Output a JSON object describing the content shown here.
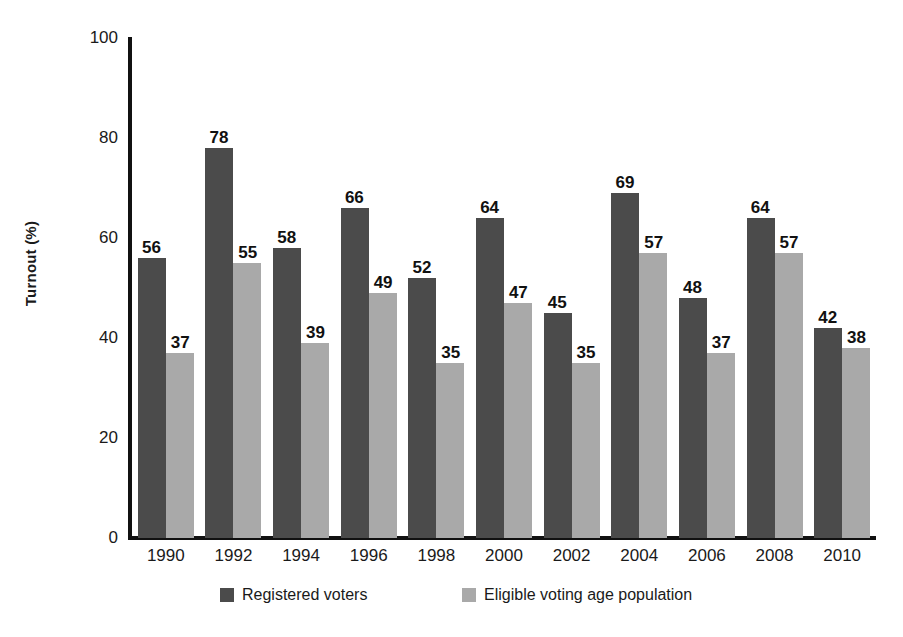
{
  "chart_data": {
    "type": "bar",
    "title": "",
    "subtitle": "",
    "xlabel": "",
    "ylabel": "Turnout (%)",
    "categories": [
      "1990",
      "1992",
      "1994",
      "1996",
      "1998",
      "2000",
      "2002",
      "2004",
      "2006",
      "2008",
      "2010"
    ],
    "series": [
      {
        "name": "Registered voters",
        "color": "#4b4b4b",
        "values": [
          56,
          78,
          58,
          66,
          52,
          64,
          45,
          69,
          48,
          64,
          42
        ]
      },
      {
        "name": "Eligible voting age population",
        "color": "#a9a9a9",
        "values": [
          37,
          55,
          39,
          49,
          35,
          47,
          35,
          57,
          37,
          57,
          38
        ]
      }
    ],
    "ylim": [
      0,
      100
    ],
    "yticks": [
      0,
      20,
      40,
      60,
      80,
      100
    ],
    "ytick_labels": [
      "0",
      "20",
      "40",
      "60",
      "80",
      "100"
    ],
    "grid": false,
    "data_labels": true,
    "legend_position": "bottom"
  },
  "legend": {
    "items": [
      {
        "label": "Registered voters",
        "color": "#4b4b4b"
      },
      {
        "label": "Eligible voting age population",
        "color": "#a9a9a9"
      }
    ]
  },
  "axis": {
    "y_title": "Turnout (%)",
    "line_color": "#111111"
  }
}
